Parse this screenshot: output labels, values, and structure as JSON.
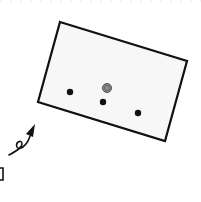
{
  "canvas": {
    "width": 201,
    "height": 202,
    "background": "#ffffff"
  },
  "colors": {
    "stroke": "#111111",
    "panel_fill": "#f7f7f7",
    "dot": "#111111",
    "face_fill": "#8a8a8a",
    "dotted_top": "#e6e6e6"
  },
  "panel": {
    "points": "60,22 187,61 165,141 38,102"
  },
  "dots": [
    {
      "cx": 70,
      "cy": 92,
      "r": 3.2
    },
    {
      "cx": 103,
      "cy": 102,
      "r": 3.2
    },
    {
      "cx": 138,
      "cy": 113,
      "r": 3.2
    }
  ],
  "face": {
    "cx": 107,
    "cy": 88,
    "r": 4.5,
    "icon": "smiley-face-icon"
  },
  "arrow": {
    "icon": "curly-arrow-icon",
    "path": "M9,155 C16,151 22,148 22,144 C22,139 15,142 17,147 C19,151 27,146 30,136",
    "head": "26,134 35,124 33,137"
  },
  "corner_fragment": {
    "path": "M0,168 L3,168 L3,180 L0,180"
  }
}
